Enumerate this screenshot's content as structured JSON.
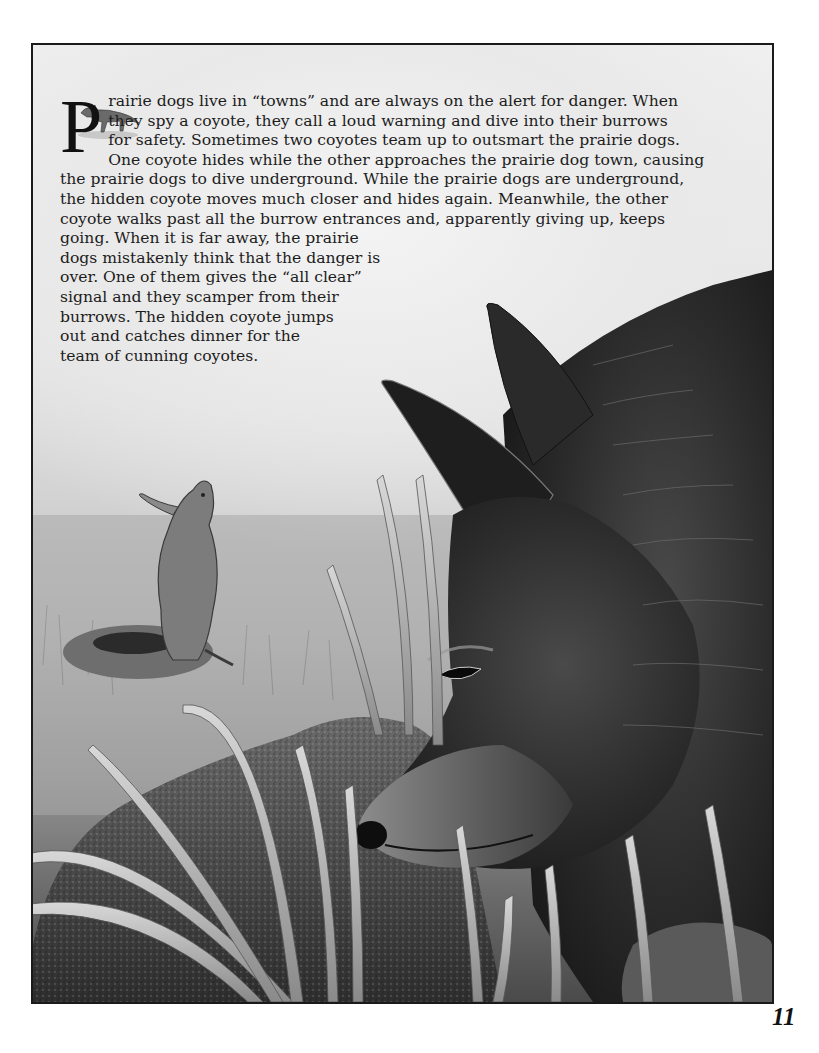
{
  "page": {
    "number": "11",
    "drop_cap": "P",
    "paragraph_lines": [
      "rairie dogs live in “towns” and are always on the alert for danger. When",
      "they spy a coyote, they call a loud warning and dive into their burrows",
      "for safety. Sometimes two coyotes team up to outsmart the prairie dogs.",
      "One coyote hides while the other approaches the prairie dog town, causing",
      "the prairie dogs to dive underground. While the prairie dogs are underground,",
      "the hidden coyote moves much closer and hides again. Meanwhile, the other",
      "coyote walks past all the burrow entrances and, apparently giving up, keeps",
      "going. When it is far away, the prairie",
      "dogs mistakenly think that the danger is",
      "over. One of them gives the “all clear”",
      "signal and they scamper from their",
      "burrows. The hidden coyote jumps",
      "out and catches dinner for the",
      "team of cunning coyotes."
    ]
  },
  "illustration": {
    "subjects": [
      "small-walking-coyote-vignette",
      "prairie-dog-standing-by-burrow",
      "coyote-head-closeup",
      "rocks",
      "tall-grass"
    ],
    "palette": {
      "sky_light": "#efefef",
      "mid_gray": "#9a9a9a",
      "dark_fur": "#2a2a2a",
      "frame_border": "#1a1a1a",
      "text": "#1c1c1c"
    }
  }
}
